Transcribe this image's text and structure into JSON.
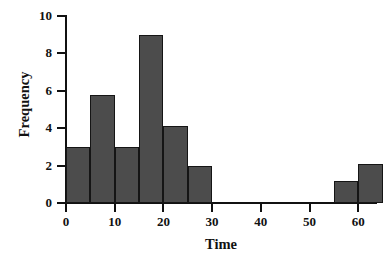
{
  "chart_data": {
    "type": "bar",
    "title": "",
    "xlabel": "Time",
    "ylabel": "Frequency",
    "xlim": [
      0,
      66
    ],
    "ylim": [
      0,
      10
    ],
    "grid": false,
    "legend": null,
    "bin_width": 5,
    "x_ticks": [
      0,
      10,
      20,
      30,
      40,
      50,
      60
    ],
    "x_tick_labels": [
      "0",
      "10",
      "20",
      "30",
      "40",
      "50",
      "60"
    ],
    "y_ticks": [
      0,
      2,
      4,
      6,
      8,
      10
    ],
    "y_tick_labels": [
      "0",
      "2",
      "4",
      "6",
      "8",
      "10"
    ],
    "bar_color": "#4c4c4c",
    "bar_edge_color": "#151515",
    "axis_color": "#111111",
    "categories": [
      "0-5",
      "5-10",
      "10-15",
      "15-20",
      "20-25",
      "25-30",
      "55-60",
      "60-65"
    ],
    "bins": [
      {
        "start": 0,
        "end": 5,
        "value": 3.0
      },
      {
        "start": 5,
        "end": 10,
        "value": 5.8
      },
      {
        "start": 10,
        "end": 15,
        "value": 3.0
      },
      {
        "start": 15,
        "end": 20,
        "value": 9.0
      },
      {
        "start": 20,
        "end": 25,
        "value": 4.1
      },
      {
        "start": 25,
        "end": 30,
        "value": 2.0
      },
      {
        "start": 55,
        "end": 60,
        "value": 1.2
      },
      {
        "start": 60,
        "end": 65,
        "value": 2.1
      }
    ],
    "values": [
      3.0,
      5.8,
      3.0,
      9.0,
      4.1,
      2.0,
      1.2,
      2.1
    ]
  }
}
